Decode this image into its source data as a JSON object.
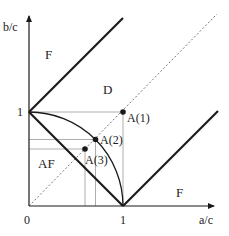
{
  "diagram": {
    "axes": {
      "x_label": "a/c",
      "y_label": "b/c",
      "origin_label": "0",
      "x_tick_label": "1",
      "y_tick_label": "1"
    },
    "regions": [
      {
        "id": "F_upper",
        "label": "F"
      },
      {
        "id": "D",
        "label": "D"
      },
      {
        "id": "AF",
        "label": "AF"
      },
      {
        "id": "F_lower",
        "label": "F"
      }
    ],
    "points": [
      {
        "id": "A1",
        "label": "A(1)",
        "x": 1.0,
        "y": 1.0
      },
      {
        "id": "A2",
        "label": "A(2)",
        "x": 0.71,
        "y": 0.71
      },
      {
        "id": "A3",
        "label": "A(3)",
        "x": 0.6,
        "y": 0.6
      }
    ],
    "curves": [
      {
        "id": "upper-boundary",
        "type": "line",
        "from": [
          0,
          1
        ],
        "to": [
          1,
          2
        ],
        "style": "thick"
      },
      {
        "id": "lower-boundary",
        "type": "line",
        "from": [
          1,
          0
        ],
        "to": [
          2,
          1
        ],
        "style": "thick"
      },
      {
        "id": "af-boundary",
        "type": "line",
        "from": [
          0,
          1
        ],
        "to": [
          1,
          0
        ],
        "style": "thick"
      },
      {
        "id": "quarter-circle",
        "type": "arc",
        "center": [
          0,
          0
        ],
        "radius": 1,
        "style": "thin"
      },
      {
        "id": "diagonal",
        "type": "line",
        "from": [
          0,
          0
        ],
        "to": [
          2,
          2
        ],
        "style": "dotted"
      }
    ],
    "colors": {
      "stroke": "#1a1a1a",
      "guide": "#888888",
      "background": "#ffffff"
    }
  }
}
